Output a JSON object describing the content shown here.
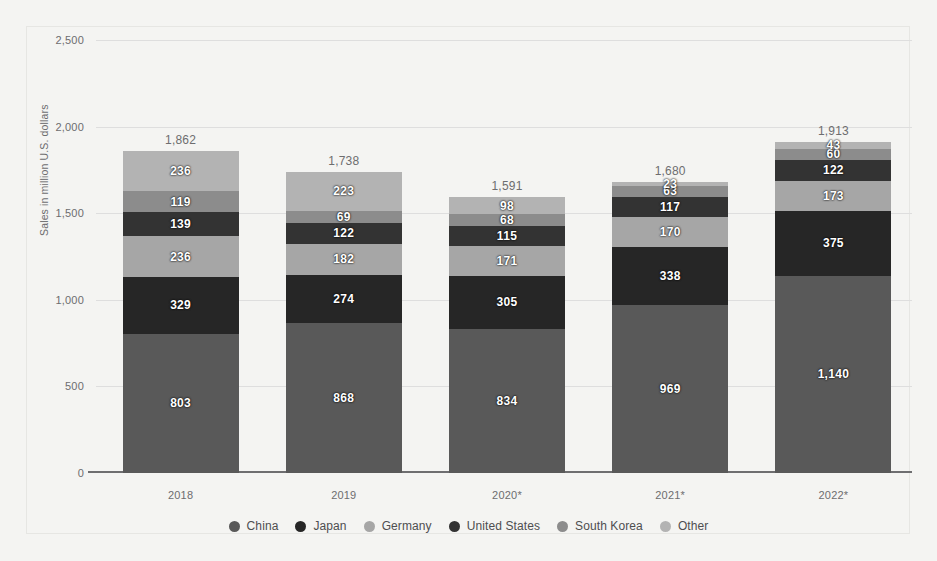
{
  "chart_data": {
    "type": "bar",
    "stacked": true,
    "title": "",
    "xlabel": "",
    "ylabel": "Sales in million U.S. dollars",
    "categories": [
      "2018",
      "2019",
      "2020*",
      "2021*",
      "2022*"
    ],
    "ylim": [
      0,
      2500
    ],
    "yticks": [
      "0",
      "500",
      "1,000",
      "1,500",
      "2,000",
      "2,500"
    ],
    "ytick_values": [
      0,
      500,
      1000,
      1500,
      2000,
      2500
    ],
    "grid": true,
    "legend_position": "bottom",
    "series": [
      {
        "name": "China",
        "color": "#595959",
        "values": [
          803,
          868,
          834,
          969,
          1140
        ],
        "labels": [
          "803",
          "868",
          "834",
          "969",
          "1,140"
        ]
      },
      {
        "name": "Japan",
        "color": "#262626",
        "values": [
          329,
          274,
          305,
          338,
          375
        ],
        "labels": [
          "329",
          "274",
          "305",
          "338",
          "375"
        ]
      },
      {
        "name": "Germany",
        "color": "#a6a6a6",
        "values": [
          236,
          182,
          171,
          170,
          173
        ],
        "labels": [
          "236",
          "182",
          "171",
          "170",
          "173"
        ]
      },
      {
        "name": "United States",
        "color": "#333333",
        "values": [
          139,
          122,
          115,
          117,
          122
        ],
        "labels": [
          "139",
          "122",
          "115",
          "117",
          "122"
        ]
      },
      {
        "name": "South Korea",
        "color": "#8c8c8c",
        "values": [
          119,
          69,
          68,
          63,
          60
        ],
        "labels": [
          "119",
          "69",
          "68",
          "63",
          "60"
        ]
      },
      {
        "name": "Other",
        "color": "#b3b3b3",
        "values": [
          236,
          223,
          98,
          23,
          43
        ],
        "labels": [
          "236",
          "223",
          "98",
          "23",
          "43"
        ]
      }
    ],
    "totals": [
      1862,
      1738,
      1591,
      1680,
      1913
    ],
    "total_labels": [
      "1,862",
      "1,738",
      "1,591",
      "1,680",
      "1,913"
    ]
  },
  "legend": {
    "items": [
      {
        "label": "China"
      },
      {
        "label": "Japan"
      },
      {
        "label": "Germany"
      },
      {
        "label": "United States"
      },
      {
        "label": "South Korea"
      },
      {
        "label": "Other"
      }
    ]
  }
}
